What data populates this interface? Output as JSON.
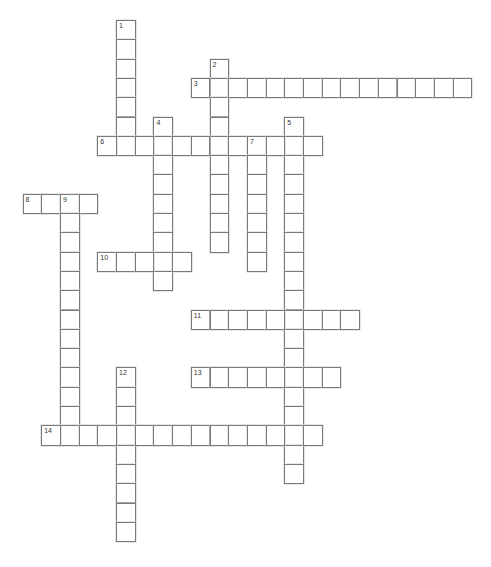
{
  "puzzle": {
    "layout": {
      "origin_x": 22.5,
      "origin_y": 20,
      "cell_w": 18.7,
      "cell_h": 19.3
    },
    "words": [
      {
        "number": 1,
        "direction": "down",
        "row": 0,
        "col": 5,
        "length": 7
      },
      {
        "number": 2,
        "direction": "down",
        "row": 2,
        "col": 10,
        "length": 10
      },
      {
        "number": 3,
        "direction": "across",
        "row": 3,
        "col": 9,
        "length": 15
      },
      {
        "number": 4,
        "direction": "down",
        "row": 5,
        "col": 7,
        "length": 9
      },
      {
        "number": 5,
        "direction": "down",
        "row": 5,
        "col": 14,
        "length": 19
      },
      {
        "number": 6,
        "direction": "across",
        "row": 6,
        "col": 4,
        "length": 12
      },
      {
        "number": 7,
        "direction": "down",
        "row": 6,
        "col": 12,
        "length": 7
      },
      {
        "number": 8,
        "direction": "across",
        "row": 9,
        "col": 0,
        "length": 4
      },
      {
        "number": 9,
        "direction": "down",
        "row": 9,
        "col": 2,
        "length": 13
      },
      {
        "number": 10,
        "direction": "across",
        "row": 12,
        "col": 4,
        "length": 5
      },
      {
        "number": 11,
        "direction": "across",
        "row": 15,
        "col": 9,
        "length": 9
      },
      {
        "number": 12,
        "direction": "down",
        "row": 18,
        "col": 5,
        "length": 9
      },
      {
        "number": 13,
        "direction": "across",
        "row": 18,
        "col": 9,
        "length": 8
      },
      {
        "number": 14,
        "direction": "across",
        "row": 21,
        "col": 1,
        "length": 15
      }
    ]
  }
}
